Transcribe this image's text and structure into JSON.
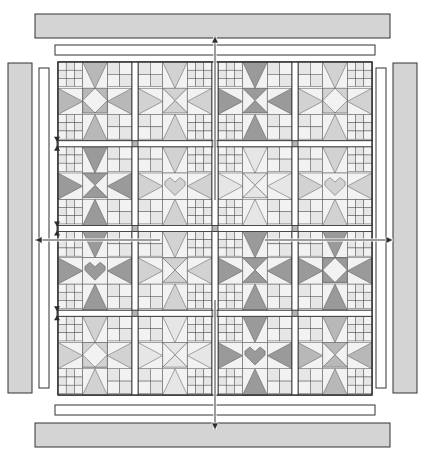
{
  "diagram": {
    "type": "quilt-assembly-layout",
    "quilt": {
      "rows": 4,
      "columns": 4,
      "block_count": 16,
      "block_label": "sampler-block",
      "sashing": {
        "label": "sashing-strip",
        "has_cornerstones": true,
        "cornerstone_label": "cornerstone",
        "cornerstone_count": 9
      }
    },
    "borders": [
      {
        "name": "top-inner-border",
        "position": "top",
        "style": "inner",
        "fill": "#ffffff"
      },
      {
        "name": "top-outer-border",
        "position": "top",
        "style": "outer",
        "fill": "#d4d4d4"
      },
      {
        "name": "bottom-inner-border",
        "position": "bottom",
        "style": "inner",
        "fill": "#ffffff"
      },
      {
        "name": "bottom-outer-border",
        "position": "bottom",
        "style": "outer",
        "fill": "#d4d4d4"
      },
      {
        "name": "left-inner-border",
        "position": "left",
        "style": "inner",
        "fill": "#ffffff"
      },
      {
        "name": "left-outer-border",
        "position": "left",
        "style": "outer",
        "fill": "#d4d4d4"
      },
      {
        "name": "right-inner-border",
        "position": "right",
        "style": "inner",
        "fill": "#ffffff"
      },
      {
        "name": "right-outer-border",
        "position": "right",
        "style": "outer",
        "fill": "#d4d4d4"
      }
    ],
    "arrows": [
      {
        "name": "attach-top-border-arrow",
        "direction": "up"
      },
      {
        "name": "attach-bottom-border-arrow",
        "direction": "down"
      },
      {
        "name": "attach-left-border-arrow",
        "direction": "left"
      },
      {
        "name": "attach-right-border-arrow",
        "direction": "right"
      }
    ],
    "measure_marks": [
      {
        "name": "sashing-width-mark-upper"
      },
      {
        "name": "sashing-width-mark-middle"
      },
      {
        "name": "sashing-width-mark-lower"
      }
    ],
    "colors": {
      "outline": "#333333",
      "line": "#555555",
      "border_fill": "#d4d4d4",
      "inner_fill": "#ffffff",
      "patch_light": "#f2f2f2",
      "patch_pale": "#e6e6e6",
      "patch_mid": "#d2d2d2",
      "patch_dark": "#b8b8b8",
      "patch_deep": "#9a9a9a",
      "cornerstone": "#b5b5b5",
      "background": "#ffffff"
    }
  },
  "chart_data": {
    "type": "table",
    "categories": [
      "Col 1",
      "Col 2",
      "Col 3",
      "Col 4"
    ],
    "rows": [
      "Row 1",
      "Row 2",
      "Row 3",
      "Row 4"
    ],
    "blocks": [
      [
        {
          "motif": "star",
          "accent": "dark"
        },
        {
          "motif": "pinwheel",
          "accent": "mid"
        },
        {
          "motif": "star-spin",
          "accent": "deep"
        },
        {
          "motif": "star",
          "accent": "mid"
        }
      ],
      [
        {
          "motif": "star-spin",
          "accent": "deep"
        },
        {
          "motif": "heart",
          "accent": "mid"
        },
        {
          "motif": "pinwheel",
          "accent": "pale"
        },
        {
          "motif": "heart",
          "accent": "mid"
        }
      ],
      [
        {
          "motif": "heart",
          "accent": "deep"
        },
        {
          "motif": "pinwheel",
          "accent": "mid"
        },
        {
          "motif": "star-spin",
          "accent": "deep"
        },
        {
          "motif": "star",
          "accent": "deep"
        }
      ],
      [
        {
          "motif": "star",
          "accent": "mid"
        },
        {
          "motif": "star-spin",
          "accent": "pale"
        },
        {
          "motif": "heart",
          "accent": "deep"
        },
        {
          "motif": "pinwheel",
          "accent": "dark"
        }
      ]
    ]
  }
}
